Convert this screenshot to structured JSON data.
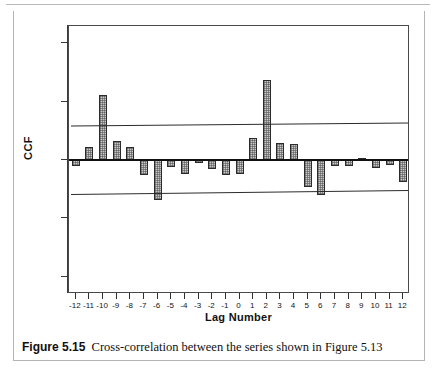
{
  "figure": {
    "caption_label": "Figure 5.15",
    "caption_text": "Cross-correlation between the series shown in Figure 5.13"
  },
  "chart_data": {
    "type": "bar",
    "title": "",
    "subtitle": "",
    "xlabel": "Lag Number",
    "ylabel": "CCF",
    "xlim": [
      -12.5,
      12.5
    ],
    "ylim": [
      -1.15,
      1.15
    ],
    "grid": false,
    "legend": "none",
    "ytick_labels": [
      "1.0",
      "0.5",
      "0.0",
      "-0.5",
      "-1.0"
    ],
    "ytick_values": [
      1.0,
      0.5,
      0.0,
      -0.5,
      -1.0
    ],
    "categories": [
      -12,
      -11,
      -10,
      -9,
      -8,
      -7,
      -6,
      -5,
      -4,
      -3,
      -2,
      -1,
      0,
      1,
      2,
      3,
      4,
      5,
      6,
      7,
      8,
      9,
      10,
      11,
      12
    ],
    "xtick_labels": [
      "-12",
      "-11",
      "-10",
      "-9",
      "-8",
      "-7",
      "-6",
      "-5",
      "-4",
      "-3",
      "-2",
      "-1",
      "0",
      "1",
      "2",
      "3",
      "4",
      "5",
      "6",
      "7",
      "8",
      "9",
      "10",
      "11",
      "12"
    ],
    "values": [
      -0.05,
      0.11,
      0.56,
      0.16,
      0.11,
      -0.13,
      -0.34,
      -0.06,
      -0.12,
      -0.03,
      -0.08,
      -0.13,
      -0.12,
      0.19,
      0.69,
      0.15,
      0.14,
      -0.23,
      -0.3,
      -0.05,
      -0.05,
      0.02,
      -0.07,
      -0.04,
      -0.19
    ],
    "series": [
      {
        "name": "CCF",
        "values": [
          -0.05,
          0.11,
          0.56,
          0.16,
          0.11,
          -0.13,
          -0.34,
          -0.06,
          -0.12,
          -0.03,
          -0.08,
          -0.13,
          -0.12,
          0.19,
          0.69,
          0.15,
          0.14,
          -0.23,
          -0.3,
          -0.05,
          -0.05,
          0.02,
          -0.07,
          -0.04,
          -0.19
        ]
      }
    ],
    "confidence_bounds": {
      "upper_left": 0.295,
      "upper_right": 0.32,
      "lower_left": -0.295,
      "lower_right": -0.26
    },
    "zero_reference": 0.0,
    "bar_fill": "#c9c9c9",
    "bar_edge": "#2b2b2b",
    "axis_color": "#3a3a3a"
  }
}
